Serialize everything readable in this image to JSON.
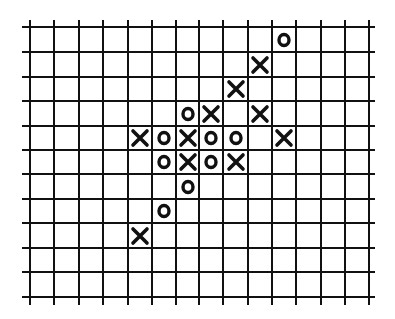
{
  "board": {
    "columns": 14,
    "rows": 11,
    "line_color": "#111111",
    "background": "#ffffff",
    "x_lines": [
      30,
      54,
      79,
      103,
      128,
      152,
      176,
      199,
      223,
      248,
      272,
      296,
      321,
      345,
      369
    ],
    "y_lines": [
      27,
      52,
      77,
      101,
      126,
      150,
      174,
      199,
      223,
      248,
      272,
      297
    ],
    "v_extent": [
      20,
      305
    ],
    "h_extent": [
      22,
      375
    ]
  },
  "pieces": [
    {
      "symbol": "O",
      "row": 0,
      "col": 10
    },
    {
      "symbol": "X",
      "row": 1,
      "col": 9
    },
    {
      "symbol": "X",
      "row": 2,
      "col": 8
    },
    {
      "symbol": "O",
      "row": 3,
      "col": 6
    },
    {
      "symbol": "X",
      "row": 3,
      "col": 7
    },
    {
      "symbol": "X",
      "row": 3,
      "col": 9
    },
    {
      "symbol": "X",
      "row": 4,
      "col": 4
    },
    {
      "symbol": "O",
      "row": 4,
      "col": 5
    },
    {
      "symbol": "X",
      "row": 4,
      "col": 6
    },
    {
      "symbol": "O",
      "row": 4,
      "col": 7
    },
    {
      "symbol": "O",
      "row": 4,
      "col": 8
    },
    {
      "symbol": "X",
      "row": 4,
      "col": 10
    },
    {
      "symbol": "O",
      "row": 5,
      "col": 5
    },
    {
      "symbol": "X",
      "row": 5,
      "col": 6
    },
    {
      "symbol": "O",
      "row": 5,
      "col": 7
    },
    {
      "symbol": "X",
      "row": 5,
      "col": 8
    },
    {
      "symbol": "O",
      "row": 6,
      "col": 6
    },
    {
      "symbol": "O",
      "row": 7,
      "col": 5
    },
    {
      "symbol": "X",
      "row": 8,
      "col": 4
    }
  ]
}
